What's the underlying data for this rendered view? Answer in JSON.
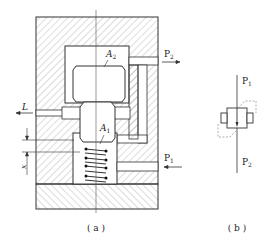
{
  "figure": {
    "panel_a": {
      "caption": "( a )",
      "labels": {
        "A2": {
          "main": "A",
          "sub": "2"
        },
        "A1": {
          "main": "A",
          "sub": "1"
        },
        "L": "L",
        "x": "x",
        "P2": {
          "main": "P",
          "sub": "2"
        },
        "P1": {
          "main": "P",
          "sub": "1"
        }
      }
    },
    "panel_b": {
      "caption": "( b )",
      "labels": {
        "P1": {
          "main": "P",
          "sub": "1"
        },
        "P2": {
          "main": "P",
          "sub": "2"
        }
      }
    },
    "colors": {
      "line": "#333333",
      "hatch": "#8a8a8a",
      "dashed": "#999999",
      "background": "#ffffff"
    }
  }
}
